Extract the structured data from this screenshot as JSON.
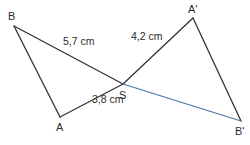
{
  "figure": {
    "points": {
      "B": {
        "label": "B",
        "x": 14,
        "y": 26
      },
      "A": {
        "label": "A",
        "x": 60,
        "y": 117
      },
      "S": {
        "label": "S",
        "x": 123,
        "y": 84
      },
      "A2": {
        "label": "A'",
        "x": 193,
        "y": 18
      },
      "B2": {
        "label": "B'",
        "x": 241,
        "y": 121
      }
    },
    "segments": [
      {
        "id": "BA",
        "from": "B",
        "to": "A",
        "color": "#333333"
      },
      {
        "id": "BS",
        "from": "B",
        "to": "S",
        "color": "#333333"
      },
      {
        "id": "AS",
        "from": "A",
        "to": "S",
        "color": "#333333"
      },
      {
        "id": "SA2",
        "from": "S",
        "to": "A2",
        "color": "#333333"
      },
      {
        "id": "A2B2",
        "from": "A2",
        "to": "B2",
        "color": "#333333"
      },
      {
        "id": "SB2",
        "from": "S",
        "to": "B2",
        "color": "#4a78a8"
      }
    ],
    "lengths": {
      "BS": "5,7 cm",
      "SA2": "4,2 cm",
      "AS": "3,8 cm"
    }
  }
}
